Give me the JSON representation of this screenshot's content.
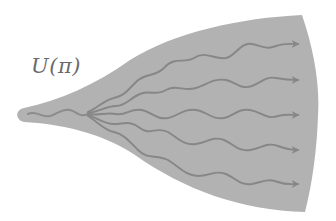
{
  "diagram": {
    "label": "U(π)",
    "colors": {
      "fill": "#b2b2b2",
      "wave": "#878787",
      "label": "#6a6a6a",
      "background": "#ffffff"
    },
    "shape": {
      "type": "horn",
      "tip": [
        22,
        115
      ],
      "top_right": [
        302,
        15
      ],
      "bottom_right": [
        305,
        212
      ],
      "right_bulge_x": 318
    },
    "waves": {
      "count": 5,
      "origin": [
        30,
        113
      ],
      "arrow_tips_y": [
        44,
        80,
        115,
        150,
        184
      ]
    }
  }
}
